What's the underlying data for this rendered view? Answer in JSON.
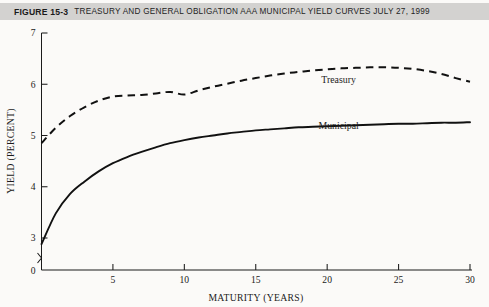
{
  "caption": {
    "figure_number": "FIGURE 15-3",
    "title": "Treasury and General Obligation Aaa Municipal Yield Curves July 27, 1999",
    "band_color": "#d3d2d0"
  },
  "chart_data": {
    "type": "line",
    "title": "Treasury and General Obligation Aaa Municipal Yield Curves July 27, 1999",
    "xlabel": "MATURITY (YEARS)",
    "ylabel": "YIELD (PERCENT)",
    "xlim": [
      0,
      30
    ],
    "ylim": [
      2.7,
      7
    ],
    "xticks": [
      0,
      5,
      10,
      15,
      20,
      25,
      30
    ],
    "xtick_labels": [
      "0",
      "5",
      "10",
      "15",
      "20",
      "25",
      "30"
    ],
    "yticks": [
      3,
      4,
      5,
      6,
      7
    ],
    "ytick_labels": [
      "3",
      "4",
      "5",
      "6",
      "7"
    ],
    "y_origin_label": "0",
    "axis_break": true,
    "grid": false,
    "legend": "inline-annotations",
    "x": [
      0,
      1,
      2,
      3,
      4,
      5,
      6,
      7,
      8,
      9,
      10,
      11,
      12,
      13,
      14,
      15,
      16,
      17,
      18,
      19,
      20,
      21,
      22,
      23,
      24,
      25,
      26,
      27,
      28,
      29,
      30
    ],
    "series": [
      {
        "name": "Treasury",
        "style": "dashed",
        "label_x": 20.8,
        "label_y": 6.02,
        "values": [
          4.85,
          5.15,
          5.38,
          5.55,
          5.68,
          5.76,
          5.78,
          5.79,
          5.82,
          5.85,
          5.8,
          5.88,
          5.95,
          6.01,
          6.07,
          6.12,
          6.17,
          6.21,
          6.24,
          6.27,
          6.29,
          6.31,
          6.32,
          6.33,
          6.33,
          6.32,
          6.3,
          6.26,
          6.2,
          6.12,
          6.05
        ]
      },
      {
        "name": "Municipal",
        "style": "solid",
        "label_x": 20.8,
        "label_y": 5.12,
        "values": [
          2.88,
          3.48,
          3.86,
          4.1,
          4.3,
          4.46,
          4.58,
          4.68,
          4.77,
          4.85,
          4.91,
          4.96,
          5.0,
          5.04,
          5.07,
          5.1,
          5.12,
          5.14,
          5.16,
          5.17,
          5.18,
          5.19,
          5.2,
          5.21,
          5.22,
          5.23,
          5.23,
          5.24,
          5.25,
          5.25,
          5.26
        ]
      }
    ]
  }
}
